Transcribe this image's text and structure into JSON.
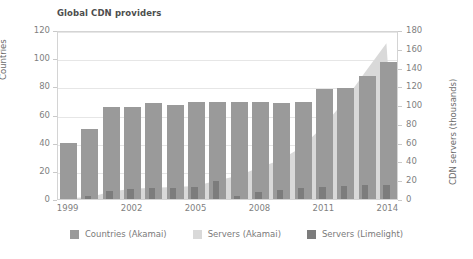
{
  "chart_data": {
    "type": "bar",
    "title": "Global CDN providers",
    "xlabel": "",
    "ylabel": "Countries",
    "ylabel_right": "CDN servers (thousands)",
    "ylim": [
      0,
      120
    ],
    "ylim_right": [
      0,
      180
    ],
    "yticks": [
      0,
      20,
      40,
      60,
      80,
      100,
      120
    ],
    "yticks_right": [
      0,
      20,
      40,
      60,
      80,
      100,
      120,
      140,
      160,
      180
    ],
    "grid": true,
    "legend_position": "bottom",
    "categories": [
      1999,
      2000,
      2001,
      2002,
      2003,
      2004,
      2005,
      2006,
      2007,
      2008,
      2009,
      2010,
      2011,
      2012,
      2013,
      2014
    ],
    "xtick_labels": [
      "1999",
      "2002",
      "2005",
      "2008",
      "2011",
      "2014"
    ],
    "xtick_categories": [
      1999,
      2002,
      2005,
      2008,
      2011,
      2014
    ],
    "series": [
      {
        "name": "Countries (Akamai)",
        "kind": "bar",
        "axis": "left",
        "color": "#9a9a9a",
        "values": [
          40,
          50,
          65,
          65,
          68,
          67,
          69,
          69,
          69,
          69,
          68,
          69,
          78,
          79,
          87,
          97
        ]
      },
      {
        "name": "Servers (Akamai)",
        "kind": "area",
        "axis": "right",
        "color": "#d9d9d9",
        "values": [
          1,
          2,
          8,
          11,
          12,
          13,
          14,
          20,
          25,
          34,
          42,
          56,
          78,
          105,
          137,
          168
        ]
      },
      {
        "name": "Servers (Limelight)",
        "kind": "bar",
        "axis": "right",
        "color": "#7c7c7c",
        "values": [
          0,
          3,
          9,
          11,
          12,
          12,
          13,
          19,
          3,
          7,
          10,
          12,
          13,
          14,
          15,
          15
        ]
      }
    ]
  },
  "colors": {
    "countries": "#9a9a9a",
    "servers_akamai": "#d9d9d9",
    "servers_limelight": "#7c7c7c",
    "grid": "#e6e6e6",
    "frame": "#d4d4d4",
    "text": "#7f7f7f",
    "title": "#4d4d4d"
  },
  "legend": [
    {
      "label": "Countries (Akamai)",
      "color": "#9a9a9a",
      "icon": "legend-swatch-icon"
    },
    {
      "label": "Servers (Akamai)",
      "color": "#d9d9d9",
      "icon": "legend-swatch-icon"
    },
    {
      "label": "Servers (Limelight)",
      "color": "#7c7c7c",
      "icon": "legend-swatch-icon"
    }
  ]
}
